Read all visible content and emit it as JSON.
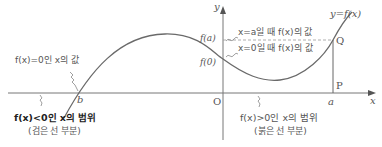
{
  "diagram": {
    "curve_label": "y=f(x)",
    "axes": {
      "x_label": "x",
      "y_label": "y",
      "origin_label": "O"
    },
    "points": {
      "b": "b",
      "a": "a",
      "P": "P",
      "Q": "Q"
    },
    "y_ticks": {
      "fa": "f(a)",
      "f0": "f(0)"
    },
    "annotations": {
      "root": "f(x)=0인 x의 값",
      "value_at_a": "x=a일 때 f(x)의 값",
      "value_at_0": "x=0일 때 f(x)의 값",
      "negative_region": "f(x)<0인 x의 범위",
      "negative_region_note": "(검은 선 부분)",
      "positive_region": "f(x)>0인 x의 범위",
      "positive_region_note": "(붉은 선 부분)"
    },
    "colors": {
      "axis": "#666666",
      "curve": "#6a6a6a",
      "dashed": "#999999",
      "text": "#555555"
    }
  }
}
